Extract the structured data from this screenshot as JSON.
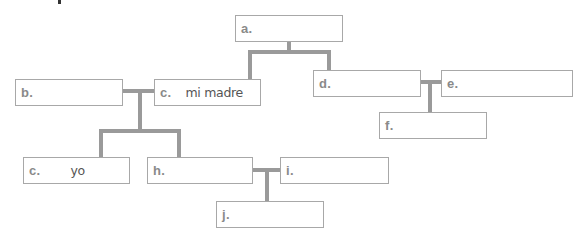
{
  "diagram": {
    "type": "family-tree",
    "nodes": [
      {
        "id": "a",
        "label": "a.",
        "value": ""
      },
      {
        "id": "b",
        "label": "b.",
        "value": ""
      },
      {
        "id": "c_madre",
        "label": "c.",
        "value": "mi madre"
      },
      {
        "id": "d",
        "label": "d.",
        "value": ""
      },
      {
        "id": "e",
        "label": "e.",
        "value": ""
      },
      {
        "id": "f",
        "label": "f.",
        "value": ""
      },
      {
        "id": "c_yo",
        "label": "c.",
        "value": "yo"
      },
      {
        "id": "h",
        "label": "h.",
        "value": ""
      },
      {
        "id": "i",
        "label": "i.",
        "value": ""
      },
      {
        "id": "j",
        "label": "j.",
        "value": ""
      }
    ],
    "relations": [
      {
        "parent": "a",
        "children": [
          "c_madre",
          "d"
        ]
      },
      {
        "couple": [
          "b",
          "c_madre"
        ],
        "children": [
          "c_yo",
          "h"
        ]
      },
      {
        "couple": [
          "d",
          "e"
        ],
        "children": [
          "f"
        ]
      },
      {
        "couple": [
          "h",
          "i"
        ],
        "children": [
          "j"
        ]
      }
    ]
  },
  "colors": {
    "box_border": "#a8a8a8",
    "connector": "#9a9a9a",
    "label_text": "#8a8a8a",
    "value_text": "#555555"
  }
}
